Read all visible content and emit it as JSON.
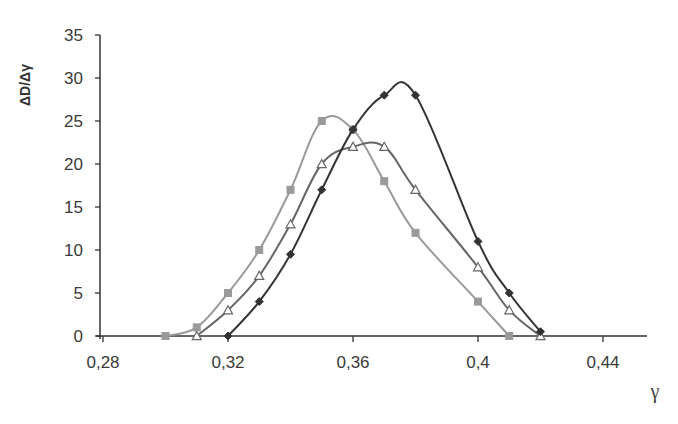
{
  "chart_data": {
    "type": "line",
    "title": "",
    "xlabel": "γ",
    "ylabel": "ΔD/Δγ",
    "xlim": [
      0.28,
      0.455
    ],
    "ylim": [
      0,
      35
    ],
    "x_ticks": [
      0.28,
      0.32,
      0.36,
      0.4,
      0.44
    ],
    "x_tick_labels": [
      "0,28",
      "0,32",
      "0,36",
      "0,4",
      "0,44"
    ],
    "y_ticks": [
      0,
      5,
      10,
      15,
      20,
      25,
      30,
      35
    ],
    "y_tick_labels": [
      "0",
      "5",
      "10",
      "15",
      "20",
      "25",
      "30",
      "35"
    ],
    "grid": false,
    "legend": null,
    "series": [
      {
        "name": "series-square",
        "marker": "square",
        "color": "#9a9a9a",
        "x": [
          0.3,
          0.31,
          0.32,
          0.33,
          0.34,
          0.35,
          0.36,
          0.37,
          0.38,
          0.4,
          0.41
        ],
        "y": [
          0,
          1,
          5,
          10,
          17,
          25,
          24,
          18,
          12,
          4,
          0
        ]
      },
      {
        "name": "series-triangle",
        "marker": "triangle",
        "color": "#666666",
        "x": [
          0.31,
          0.32,
          0.33,
          0.34,
          0.35,
          0.36,
          0.37,
          0.38,
          0.4,
          0.41,
          0.42
        ],
        "y": [
          0,
          3,
          7,
          13,
          20,
          22,
          22,
          17,
          8,
          3,
          0
        ]
      },
      {
        "name": "series-diamond",
        "marker": "diamond",
        "color": "#333333",
        "x": [
          0.32,
          0.33,
          0.34,
          0.35,
          0.36,
          0.37,
          0.38,
          0.4,
          0.41,
          0.42
        ],
        "y": [
          0,
          4,
          9.5,
          17,
          24,
          28,
          28,
          11,
          5,
          0.5
        ]
      }
    ]
  }
}
